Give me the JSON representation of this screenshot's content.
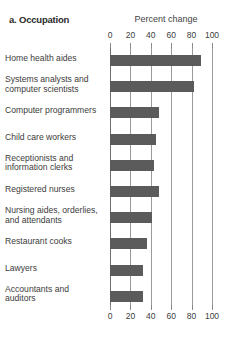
{
  "panel": {
    "title": "a. Occupation"
  },
  "chart_data": {
    "type": "bar",
    "orientation": "horizontal",
    "title": "a. Occupation",
    "xlabel": "Percent change",
    "ylabel": "",
    "xlim": [
      0,
      100
    ],
    "xticks": [
      0,
      20,
      40,
      60,
      80,
      100
    ],
    "xticklabels": [
      "0",
      "20",
      "40",
      "60",
      "80",
      "100"
    ],
    "grid": true,
    "axis_title_positions": [
      "top",
      "bottom"
    ],
    "legend": null,
    "bar_color": "#5b5b5b",
    "categories": [
      "Home health aides",
      "Systems analysts and computer scientists",
      "Computer programmers",
      "Child care workers",
      "Receptionists and information clerks",
      "Registered nurses",
      "Nursing aides, orderlies, and attendants",
      "Restaurant cooks",
      "Lawyers",
      "Accountants and auditors"
    ],
    "category_lines": [
      [
        "Home health aides",
        ""
      ],
      [
        "Systems analysts and",
        "computer scientists"
      ],
      [
        "Computer programmers",
        ""
      ],
      [
        "Child care workers",
        ""
      ],
      [
        "Receptionists and",
        "information clerks"
      ],
      [
        "Registered nurses",
        ""
      ],
      [
        "Nursing aides, orderlies,",
        "and attendants"
      ],
      [
        "Restaurant cooks",
        ""
      ],
      [
        "Lawyers",
        ""
      ],
      [
        "Accountants and",
        "auditors"
      ]
    ],
    "values": [
      89,
      82,
      48,
      45,
      43,
      48,
      41,
      36,
      32,
      32
    ]
  }
}
